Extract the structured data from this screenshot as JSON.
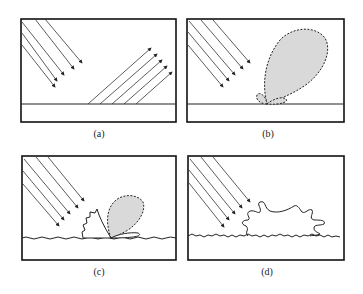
{
  "figure": {
    "panels": [
      {
        "id": "a",
        "caption": "(a)",
        "description": "Specular reflection: incident parallel rays reflected as parallel rays from a smooth surface"
      },
      {
        "id": "b",
        "caption": "(b)",
        "description": "Slightly rough surface: strong specular lobe with small diffuse lobes"
      },
      {
        "id": "c",
        "caption": "(c)",
        "description": "Rougher surface: smaller specular lobe plus diffuse scattering component"
      },
      {
        "id": "d",
        "caption": "(d)",
        "description": "Very rough surface: diffuse scattering dominates"
      }
    ],
    "colors": {
      "stroke": "#222222",
      "frame": "#111111",
      "lobe_fill": "#d9d9d9",
      "background": "#ffffff"
    }
  }
}
